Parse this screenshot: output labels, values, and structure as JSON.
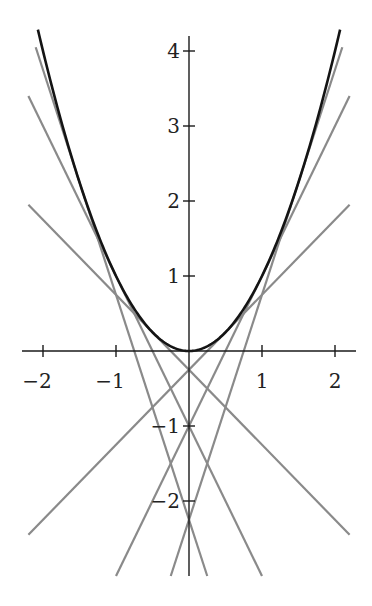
{
  "chart_data": {
    "type": "line",
    "title": "",
    "xlabel": "",
    "ylabel": "",
    "xlim": [
      -2.3,
      2.3
    ],
    "ylim": [
      -3,
      4.2
    ],
    "grid": false,
    "legend": null,
    "x_ticks": [
      -2,
      -1,
      1,
      2
    ],
    "x_tick_labels": [
      "−2",
      "−1",
      "1",
      "2"
    ],
    "y_ticks": [
      -2,
      -1,
      1,
      2,
      3,
      4
    ],
    "y_tick_labels": [
      "−2",
      "−1",
      "1",
      "2",
      "3",
      "4"
    ],
    "series": [
      {
        "name": "parabola",
        "function": "y = x^2",
        "color": "#141414",
        "x_range": [
          -2.07,
          2.07
        ]
      },
      {
        "name": "tangent a=-1.5",
        "function": "y = -3x - 2.25",
        "slope": -3,
        "intercept": -2.25,
        "color": "#8a8a8a"
      },
      {
        "name": "tangent a=-1",
        "function": "y = -2x - 1",
        "slope": -2,
        "intercept": -1,
        "color": "#8a8a8a"
      },
      {
        "name": "tangent a=-0.5",
        "function": "y = -x - 0.25",
        "slope": -1,
        "intercept": -0.25,
        "color": "#8a8a8a"
      },
      {
        "name": "tangent a=0.5",
        "function": "y = x - 0.25",
        "slope": 1,
        "intercept": -0.25,
        "color": "#8a8a8a"
      },
      {
        "name": "tangent a=1",
        "function": "y = 2x - 1",
        "slope": 2,
        "intercept": -1,
        "color": "#8a8a8a"
      },
      {
        "name": "tangent a=1.5",
        "function": "y = 3x - 2.25",
        "slope": 3,
        "intercept": -2.25,
        "color": "#8a8a8a"
      }
    ]
  },
  "layout": {
    "origin_px": [
      189,
      351
    ],
    "x_scale_px": 73,
    "y_scale_px": 75
  }
}
